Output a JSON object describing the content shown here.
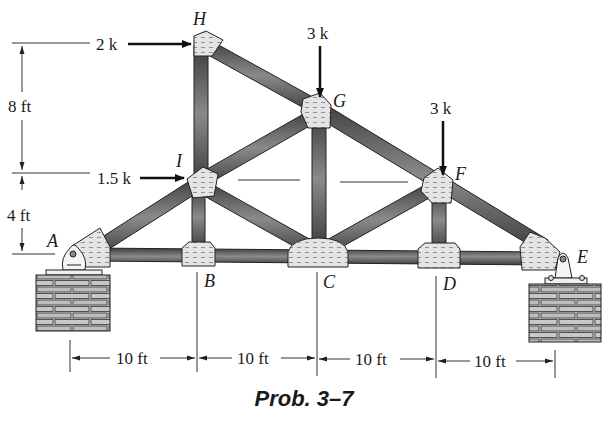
{
  "figure": {
    "caption": "Prob. 3–7",
    "type": "roof truss"
  },
  "nodes": [
    {
      "id": "A",
      "label": "A"
    },
    {
      "id": "B",
      "label": "B"
    },
    {
      "id": "C",
      "label": "C"
    },
    {
      "id": "D",
      "label": "D"
    },
    {
      "id": "E",
      "label": "E"
    },
    {
      "id": "F",
      "label": "F"
    },
    {
      "id": "G",
      "label": "G"
    },
    {
      "id": "H",
      "label": "H"
    },
    {
      "id": "I",
      "label": "I"
    }
  ],
  "members": [
    [
      "A",
      "B"
    ],
    [
      "B",
      "C"
    ],
    [
      "C",
      "D"
    ],
    [
      "D",
      "E"
    ],
    [
      "A",
      "I"
    ],
    [
      "I",
      "H"
    ],
    [
      "H",
      "G"
    ],
    [
      "G",
      "F"
    ],
    [
      "F",
      "E"
    ],
    [
      "I",
      "B"
    ],
    [
      "I",
      "C"
    ],
    [
      "I",
      "G"
    ],
    [
      "G",
      "C"
    ],
    [
      "C",
      "F"
    ],
    [
      "F",
      "D"
    ]
  ],
  "loads": [
    {
      "label": "2 k",
      "node": "H",
      "direction": "right"
    },
    {
      "label": "1.5 k",
      "node": "I",
      "direction": "right"
    },
    {
      "label": "3 k",
      "node": "G",
      "direction": "down"
    },
    {
      "label": "3 k",
      "node": "F",
      "direction": "down"
    }
  ],
  "supports": [
    {
      "node": "A",
      "type": "pin"
    },
    {
      "node": "E",
      "type": "pin"
    }
  ],
  "dimensions": {
    "vertical": [
      {
        "label": "8 ft"
      },
      {
        "label": "4 ft"
      }
    ],
    "horizontal": [
      {
        "label": "10 ft"
      },
      {
        "label": "10 ft"
      },
      {
        "label": "10 ft"
      },
      {
        "label": "10 ft"
      }
    ]
  }
}
